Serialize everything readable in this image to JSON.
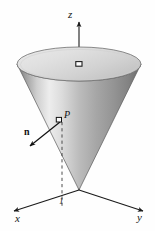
{
  "figure": {
    "kind": "3d-geometry-diagram",
    "background_color": "#fefefe",
    "ink_color": "#1a1a1a"
  },
  "axes": {
    "z": {
      "label": "z",
      "arrow": "up"
    },
    "x": {
      "label": "x",
      "arrow": "down-left"
    },
    "y": {
      "label": "y",
      "arrow": "down-right"
    }
  },
  "annotations": {
    "point": {
      "label": "P",
      "marker": "open-square"
    },
    "normal_vector": {
      "label": "n",
      "arrow": "down-left"
    },
    "tick": {
      "label": "1"
    },
    "apex_marker": {
      "label": ""
    },
    "center_marker": {
      "label": ""
    }
  },
  "surface": {
    "top_ellipse_fill_light": "#e3e3e3",
    "top_ellipse_fill_dark": "#b9b9b9",
    "cone_fill_light": "#f0f0f0",
    "cone_fill_mid": "#b0b0b0",
    "cone_fill_dark": "#6e6e6e",
    "outline": "#4a4a4a"
  }
}
